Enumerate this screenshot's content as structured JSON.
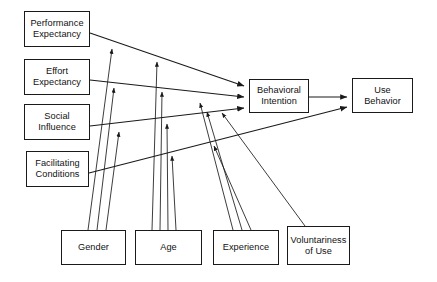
{
  "diagram": {
    "type": "path-diagram",
    "background_color": "#ffffff",
    "line_color": "#1a1a1a",
    "text_color": "#111111",
    "determinants": [
      {
        "id": "performance-expectancy",
        "label": "Performance\nExpectancy",
        "x": 24,
        "y": 11,
        "width": 66,
        "height": 36
      },
      {
        "id": "effort-expectancy",
        "label": "Effort\nExpectancy",
        "x": 24,
        "y": 59,
        "width": 66,
        "height": 36
      },
      {
        "id": "social-influence",
        "label": "Social\nInfluence",
        "x": 24,
        "y": 104,
        "width": 66,
        "height": 36
      },
      {
        "id": "facilitating-conditions",
        "label": "Facilitating\nConditions",
        "x": 26,
        "y": 151,
        "width": 63,
        "height": 36
      }
    ],
    "outcomes": [
      {
        "id": "behavioral-intention",
        "label": "Behavioral\nIntention",
        "x": 249,
        "y": 79,
        "width": 60,
        "height": 34
      },
      {
        "id": "use-behavior",
        "label": "Use\nBehavior",
        "x": 352,
        "y": 78,
        "width": 61,
        "height": 35
      }
    ],
    "moderators": [
      {
        "id": "gender",
        "label": "Gender",
        "x": 61,
        "y": 230,
        "width": 65,
        "height": 35
      },
      {
        "id": "age",
        "label": "Age",
        "x": 135,
        "y": 230,
        "width": 67,
        "height": 35
      },
      {
        "id": "experience",
        "label": "Experience",
        "x": 213,
        "y": 230,
        "width": 66,
        "height": 35
      },
      {
        "id": "voluntariness-of-use",
        "label": "Voluntariness\nof Use",
        "x": 287,
        "y": 226,
        "width": 63,
        "height": 39
      }
    ],
    "relationships": [
      {
        "from": "performance-expectancy",
        "to": "behavioral-intention"
      },
      {
        "from": "effort-expectancy",
        "to": "behavioral-intention"
      },
      {
        "from": "social-influence",
        "to": "behavioral-intention"
      },
      {
        "from": "facilitating-conditions",
        "to": "use-behavior"
      },
      {
        "from": "behavioral-intention",
        "to": "use-behavior"
      },
      {
        "from": "gender",
        "to": "performance-expectancy-path"
      },
      {
        "from": "gender",
        "to": "effort-expectancy-path"
      },
      {
        "from": "gender",
        "to": "social-influence-path"
      },
      {
        "from": "age",
        "to": "performance-expectancy-path"
      },
      {
        "from": "age",
        "to": "effort-expectancy-path"
      },
      {
        "from": "age",
        "to": "social-influence-path"
      },
      {
        "from": "age",
        "to": "facilitating-conditions-path"
      },
      {
        "from": "experience",
        "to": "effort-expectancy-path"
      },
      {
        "from": "experience",
        "to": "social-influence-path"
      },
      {
        "from": "experience",
        "to": "facilitating-conditions-path"
      },
      {
        "from": "voluntariness-of-use",
        "to": "social-influence-path"
      }
    ]
  }
}
